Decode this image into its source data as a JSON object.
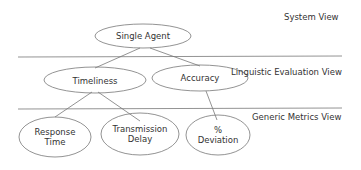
{
  "views": {
    "system": "System View",
    "linguistic": "Linguistic Evaluation View",
    "generic": "Generic Metrics View"
  },
  "nodes": {
    "root": "Single Agent",
    "timeliness": "Timeliness",
    "accuracy": "Accuracy",
    "response_time_1": "Response",
    "response_time_2": "Time",
    "transmission_delay_1": "Transmission",
    "transmission_delay_2": "Delay",
    "deviation_1": "%",
    "deviation_2": "Deviation"
  }
}
